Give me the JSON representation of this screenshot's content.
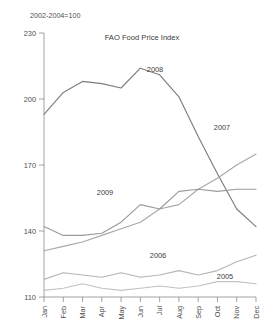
{
  "chart_data": {
    "type": "line",
    "title": "FAO Food Price Index",
    "subtitle": "2002-2004=100",
    "xlabel": "",
    "ylabel": "",
    "ylim": [
      110,
      230
    ],
    "yticks": [
      110,
      140,
      170,
      200,
      230
    ],
    "ytick_labels": [
      "110",
      "140",
      "170",
      "200",
      "230"
    ],
    "grid": false,
    "legend_position": "inline-annotations",
    "categories": [
      "Jan",
      "Feb",
      "Mar",
      "Apr",
      "May",
      "Jun",
      "Jul",
      "Aug",
      "Sep",
      "Oct",
      "Nov",
      "Dec"
    ],
    "series": [
      {
        "name": "2008",
        "color": "#7d7d7d",
        "label": "2008",
        "label_x": 155,
        "label_y": 72,
        "values": [
          193,
          203,
          208,
          207,
          205,
          214,
          211,
          201,
          183,
          166,
          150,
          142
        ]
      },
      {
        "name": "2007",
        "color": "#a8a8a8",
        "label": "2007",
        "label_x": 222,
        "label_y": 130,
        "values": [
          131,
          133,
          135,
          138,
          141,
          144,
          150,
          152,
          159,
          164,
          170,
          175
        ]
      },
      {
        "name": "2009",
        "color": "#9a9a9a",
        "label": "2009",
        "label_x": 105,
        "label_y": 195,
        "values": [
          142,
          138,
          138,
          139,
          144,
          152,
          150,
          158,
          159,
          158,
          159,
          159
        ]
      },
      {
        "name": "2006",
        "color": "#b5b5b5",
        "label": "2006",
        "label_x": 158,
        "label_y": 258,
        "values": [
          118,
          121,
          120,
          119,
          121,
          119,
          120,
          122,
          120,
          122,
          126,
          129
        ]
      },
      {
        "name": "2005",
        "color": "#c2c2c2",
        "label": "2005",
        "label_x": 225,
        "label_y": 279,
        "values": [
          113,
          114,
          116,
          114,
          113,
          114,
          115,
          114,
          115,
          117,
          117,
          116
        ]
      }
    ]
  },
  "axes": {
    "y_tick_labels": [
      "230",
      "200",
      "170",
      "140",
      "110"
    ],
    "x_tick_labels": [
      "Jan",
      "Feb",
      "Mar",
      "Apr",
      "May",
      "Jun",
      "Jul",
      "Aug",
      "Sep",
      "Oct",
      "Nov",
      "Dec"
    ]
  }
}
